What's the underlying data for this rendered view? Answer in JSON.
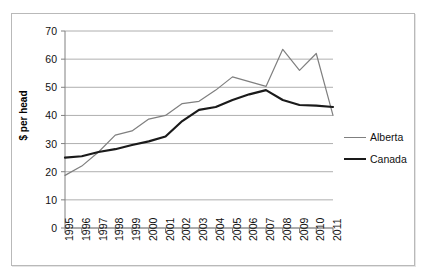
{
  "figure": {
    "frame_border_color": "#b9b9b9",
    "background_color": "#ffffff"
  },
  "axes": {
    "y_title": "$ per head",
    "y_ticks": [
      "0",
      "10",
      "20",
      "30",
      "40",
      "50",
      "60",
      "70"
    ],
    "x_ticks": [
      "1995",
      "1996",
      "1997",
      "1998",
      "1999",
      "2000",
      "2001",
      "2002",
      "2003",
      "2004",
      "2005",
      "2006",
      "2007",
      "2008",
      "2009",
      "2010",
      "2011"
    ]
  },
  "legend": {
    "position": "right",
    "entries": [
      {
        "label": "Alberta",
        "color": "#7f7f7f"
      },
      {
        "label": "Canada",
        "color": "#1a1a1a"
      }
    ]
  },
  "chart_data": {
    "type": "line",
    "title": "",
    "subtitle": "",
    "xlabel": "",
    "ylabel": "$ per head",
    "xlim": [
      1995,
      2011
    ],
    "ylim": [
      0,
      70
    ],
    "y_tick_step": 10,
    "grid": "horizontal",
    "legend_position": "right",
    "x": [
      1995,
      1996,
      1997,
      1998,
      1999,
      2000,
      2001,
      2002,
      2003,
      2004,
      2005,
      2006,
      2007,
      2008,
      2009,
      2010,
      2011
    ],
    "categories": [
      "1995",
      "1996",
      "1997",
      "1998",
      "1999",
      "2000",
      "2001",
      "2002",
      "2003",
      "2004",
      "2005",
      "2006",
      "2007",
      "2008",
      "2009",
      "2010",
      "2011"
    ],
    "series": [
      {
        "name": "Alberta",
        "color": "#7f7f7f",
        "line_width": 1.2,
        "values": [
          18.7,
          22.0,
          27.0,
          33.0,
          34.5,
          38.7,
          40.0,
          44.2,
          45.0,
          49.0,
          53.7,
          52.0,
          50.3,
          63.5,
          56.0,
          62.0,
          40.0
        ]
      },
      {
        "name": "Canada",
        "color": "#1a1a1a",
        "line_width": 2.2,
        "values": [
          25.0,
          25.5,
          27.0,
          28.0,
          29.5,
          30.8,
          32.5,
          38.0,
          42.0,
          43.0,
          45.5,
          47.5,
          49.0,
          45.5,
          43.7,
          43.5,
          43.0
        ]
      }
    ]
  },
  "plot_geometry": {
    "left": 65,
    "right": 333,
    "top": 31,
    "bottom": 228
  }
}
